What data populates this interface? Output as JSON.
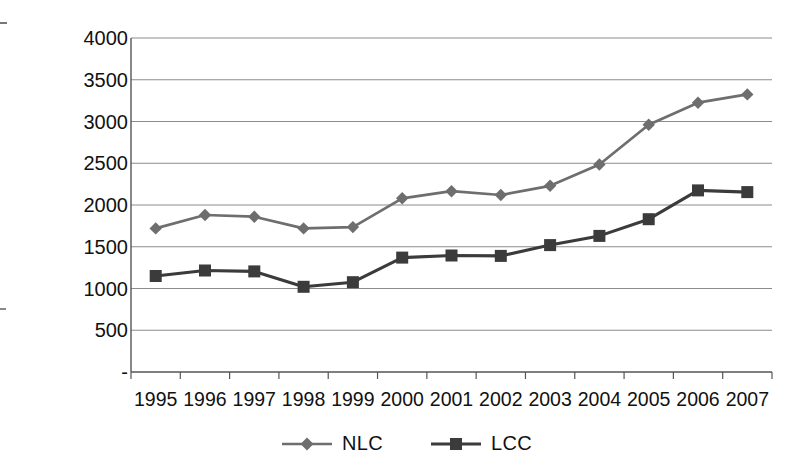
{
  "chart_data": {
    "type": "line",
    "title": "",
    "xlabel": "",
    "ylabel": "USD Per Block Hour",
    "categories": [
      "1995",
      "1996",
      "1997",
      "1998",
      "1999",
      "2000",
      "2001",
      "2002",
      "2003",
      "2004",
      "2005",
      "2006",
      "2007"
    ],
    "ylim": [
      0,
      4000
    ],
    "ytick_values": [
      0,
      500,
      1000,
      1500,
      2000,
      2500,
      3000,
      3500,
      4000
    ],
    "ytick_labels": [
      "-",
      "500",
      "1000",
      "1500",
      "2000",
      "2500",
      "3000",
      "3500",
      "4000"
    ],
    "grid": true,
    "legend_position": "bottom",
    "series": [
      {
        "name": "NLC",
        "marker": "diamond",
        "color": "#6e6e6e",
        "values": [
          1720,
          1880,
          1860,
          1720,
          1735,
          2080,
          2165,
          2120,
          2230,
          2485,
          2960,
          3225,
          3325
        ]
      },
      {
        "name": "LCC",
        "marker": "square",
        "color": "#3b3b3b",
        "values": [
          1150,
          1215,
          1205,
          1020,
          1075,
          1370,
          1395,
          1390,
          1520,
          1630,
          1830,
          2175,
          2155
        ]
      }
    ]
  },
  "axes": {
    "y_axis_title": "USD Per Block Hour"
  },
  "legend": {
    "items": [
      {
        "label": "NLC",
        "marker": "diamond",
        "color": "#6e6e6e"
      },
      {
        "label": "LCC",
        "marker": "square",
        "color": "#3b3b3b"
      }
    ]
  },
  "colors": {
    "nlc": "#6e6e6e",
    "lcc": "#3b3b3b",
    "gridline": "#8c8c8c",
    "axis": "#555555",
    "background": "#ffffff",
    "text": "#111111"
  }
}
